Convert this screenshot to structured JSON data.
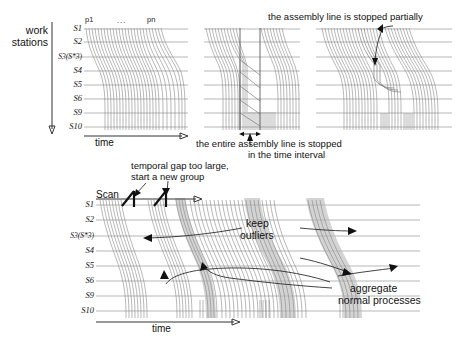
{
  "figure": {
    "axis_y_label": "work stations",
    "axis_x_label": "time",
    "station_labels": [
      "S1",
      "S2",
      "S3(S*3)",
      "S4",
      "S5",
      "S6",
      "S9",
      "S10"
    ],
    "process_tick_first": "p1",
    "process_tick_ellipsis": "...",
    "process_tick_last": "pn"
  },
  "top_row": {
    "panel1": {
      "x_axis_label": "time"
    },
    "panel2": {
      "caption_line1": "the entire assembly line is stopped",
      "caption_line2": "in the time interval"
    },
    "panel3": {
      "caption": "the assembly line is stopped partially"
    }
  },
  "bottom_panel": {
    "scan_label": "Scan",
    "gap_note_line1": "temporal gap too large,",
    "gap_note_line2": "start a new group",
    "keep_outliers_line1": "keep",
    "keep_outliers_line2": "outliers",
    "aggregate_line1": "aggregate",
    "aggregate_line2": "normal processes",
    "x_axis_label": "time"
  },
  "colors": {
    "gridline": "#9a9a9a",
    "trajectory": "#7d7d7d",
    "band": "#b9b9b9",
    "axis": "#333333",
    "annotation": "#222222"
  }
}
